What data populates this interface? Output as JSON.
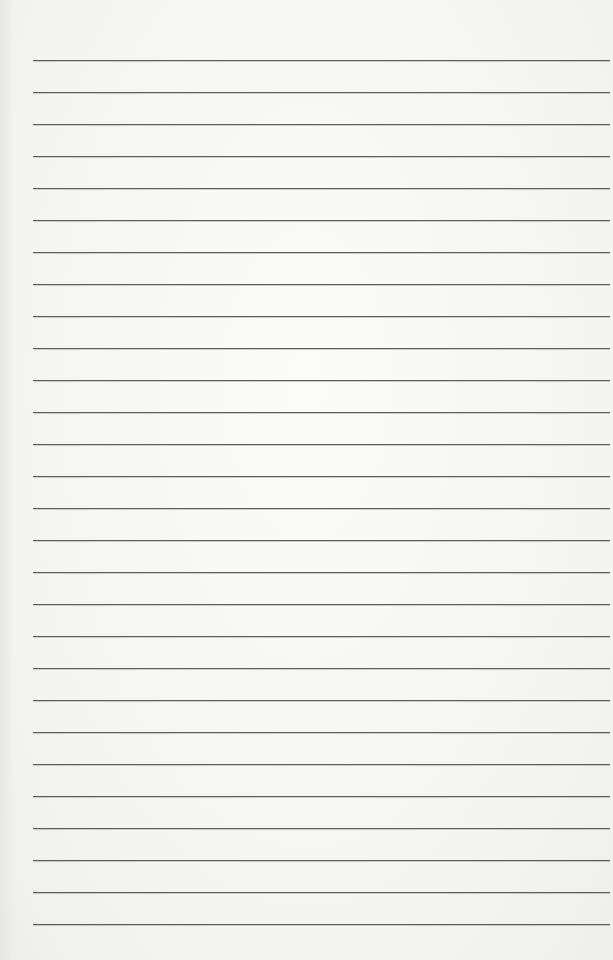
{
  "page": {
    "type": "lined-paper",
    "ruled_line_count": 28,
    "paper_color": "#f6f6f4",
    "line_color": "#5e5e5e",
    "text_content": ""
  }
}
